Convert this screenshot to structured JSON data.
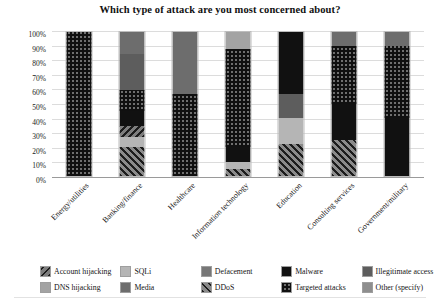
{
  "chart_data": {
    "type": "bar",
    "subtype": "100% stacked bar",
    "title": "Which type of attack are you most concerned about?",
    "xlabel": "",
    "ylabel": "",
    "ylim": [
      0,
      100
    ],
    "grid": true,
    "legend_position": "bottom",
    "ytick_labels": [
      "100%",
      "90%",
      "80%",
      "70%",
      "60%",
      "50%",
      "40%",
      "30%",
      "20%",
      "10%",
      "0%"
    ],
    "ytick_values": [
      100,
      90,
      80,
      70,
      60,
      50,
      40,
      30,
      20,
      10,
      0
    ],
    "categories": [
      "Energy/utilities",
      "Banking/finance",
      "Healthcare",
      "Information technology",
      "Education",
      "Consulting services",
      "Government/military"
    ],
    "series": [
      {
        "name": "Account hijacking",
        "key": "account",
        "color": "#7d7d7d",
        "pattern": "diagonal-hatch-backslash",
        "values": [
          0,
          8,
          0,
          0,
          0,
          0,
          0
        ]
      },
      {
        "name": "DDoS",
        "key": "ddos",
        "color": "#8a8a8a",
        "pattern": "diagonal-hatch-slash",
        "values": [
          0,
          20,
          0,
          5,
          22,
          25,
          0
        ]
      },
      {
        "name": "DNS hijacking",
        "key": "dns",
        "color": "#a3a3a3",
        "pattern": "solid",
        "values": [
          0,
          0,
          0,
          12,
          0,
          0,
          0
        ]
      },
      {
        "name": "Malware",
        "key": "malware",
        "color": "#111111",
        "pattern": "solid",
        "values": [
          0,
          10,
          0,
          10,
          43,
          25,
          40
        ]
      },
      {
        "name": "SQLi",
        "key": "sqli",
        "color": "#b5b5b5",
        "pattern": "solid",
        "values": [
          0,
          7,
          0,
          5,
          18,
          0,
          0
        ]
      },
      {
        "name": "Targeted attacks",
        "key": "targeted",
        "color": "#6f6f6f",
        "pattern": "checker-dots",
        "values": [
          100,
          15,
          57,
          68,
          0,
          40,
          50
        ]
      },
      {
        "name": "Media",
        "key": "media",
        "color": "#6d6d6d",
        "pattern": "solid",
        "values": [
          0,
          15,
          43,
          0,
          0,
          10,
          10
        ]
      },
      {
        "name": "Illegitimate access",
        "key": "illegit",
        "color": "#5d5d5d",
        "pattern": "solid",
        "values": [
          0,
          25,
          0,
          0,
          17,
          0,
          0
        ]
      },
      {
        "name": "Defacement",
        "key": "defacement",
        "color": "#777777",
        "pattern": "solid",
        "values": [
          0,
          0,
          0,
          0,
          0,
          0,
          0
        ]
      },
      {
        "name": "Other (specify)",
        "key": "other",
        "color": "#8e8e8e",
        "pattern": "solid",
        "values": [
          0,
          0,
          0,
          0,
          0,
          0,
          0
        ]
      }
    ],
    "stacks": [
      {
        "category": "Energy/utilities",
        "segments": [
          {
            "key": "targeted",
            "value": 100
          }
        ]
      },
      {
        "category": "Banking/finance",
        "segments": [
          {
            "key": "ddos",
            "value": 20
          },
          {
            "key": "sqli",
            "value": 7
          },
          {
            "key": "account",
            "value": 8
          },
          {
            "key": "malware",
            "value": 10
          },
          {
            "key": "targeted",
            "value": 15
          },
          {
            "key": "illegit",
            "value": 25
          },
          {
            "key": "media",
            "value": 15
          }
        ]
      },
      {
        "category": "Healthcare",
        "segments": [
          {
            "key": "targeted",
            "value": 57
          },
          {
            "key": "media",
            "value": 43
          }
        ]
      },
      {
        "category": "Information technology",
        "segments": [
          {
            "key": "ddos",
            "value": 5
          },
          {
            "key": "sqli",
            "value": 5
          },
          {
            "key": "malware",
            "value": 10
          },
          {
            "key": "targeted",
            "value": 68
          },
          {
            "key": "dns",
            "value": 12
          }
        ]
      },
      {
        "category": "Education",
        "segments": [
          {
            "key": "ddos",
            "value": 22
          },
          {
            "key": "sqli",
            "value": 18
          },
          {
            "key": "illegit",
            "value": 17
          },
          {
            "key": "malware",
            "value": 43
          }
        ]
      },
      {
        "category": "Consulting services",
        "segments": [
          {
            "key": "ddos",
            "value": 25
          },
          {
            "key": "malware",
            "value": 25
          },
          {
            "key": "targeted",
            "value": 40
          },
          {
            "key": "media",
            "value": 10
          }
        ]
      },
      {
        "category": "Government/military",
        "segments": [
          {
            "key": "malware",
            "value": 40
          },
          {
            "key": "targeted",
            "value": 50
          },
          {
            "key": "media",
            "value": 10
          }
        ]
      }
    ],
    "legend": [
      {
        "label": "Account hijacking",
        "key": "account"
      },
      {
        "label": "DNS hijacking",
        "key": "dns"
      },
      {
        "label": "SQLi",
        "key": "sqli"
      },
      {
        "label": "Media",
        "key": "media"
      },
      {
        "label": "Defacement",
        "key": "defacement"
      },
      {
        "label": "DDoS",
        "key": "ddos"
      },
      {
        "label": "Malware",
        "key": "malware"
      },
      {
        "label": "Targeted attacks",
        "key": "targeted"
      },
      {
        "label": "Illegitimate access",
        "key": "illegit"
      },
      {
        "label": "Other (specify)",
        "key": "other"
      }
    ]
  }
}
